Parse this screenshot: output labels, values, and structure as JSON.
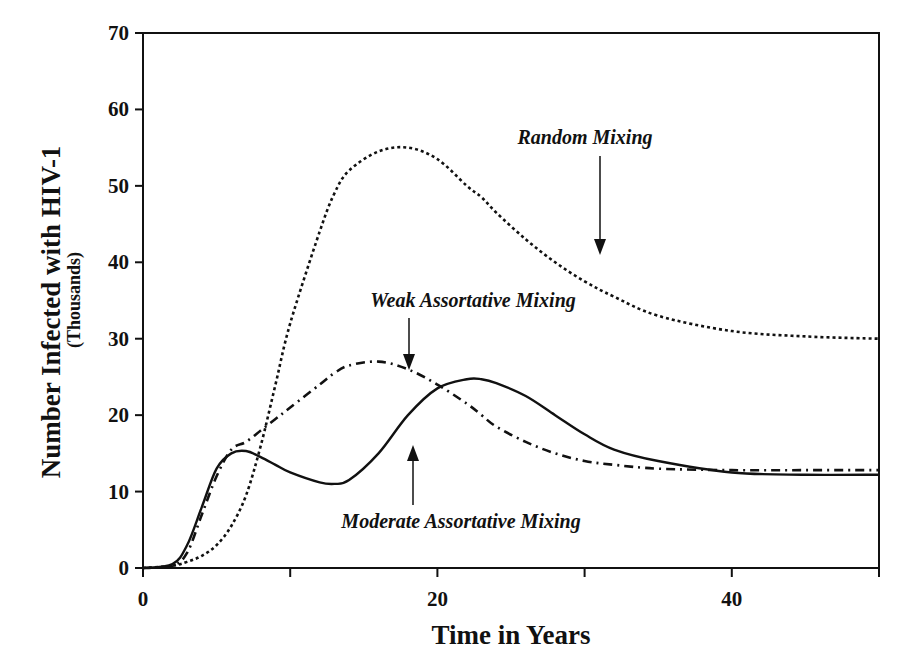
{
  "chart_data": {
    "type": "line",
    "title": "",
    "xlabel": "Time in Years",
    "ylabel": "Number Infected with HIV-1",
    "ylabel_sub": "(Thousands)",
    "xlim": [
      0,
      50
    ],
    "ylim": [
      0,
      70
    ],
    "x_ticks": [
      0,
      10,
      20,
      30,
      40,
      50
    ],
    "x_tick_labels": [
      "0",
      "20",
      "40"
    ],
    "y_ticks": [
      0,
      10,
      20,
      30,
      40,
      50,
      60,
      70
    ],
    "y_tick_labels": [
      "0",
      "10",
      "20",
      "30",
      "40",
      "50",
      "60",
      "70"
    ],
    "grid": false,
    "legend": "none (inline annotations with arrows)",
    "x": [
      0,
      2,
      3,
      4,
      5,
      6,
      7,
      8,
      9,
      10,
      12,
      13,
      14,
      16,
      18,
      20,
      22,
      23,
      24,
      26,
      28,
      30,
      32,
      35,
      40,
      45,
      50
    ],
    "series": [
      {
        "name": "Random Mixing",
        "style": "dotted",
        "values": [
          0,
          0.3,
          0.8,
          1.6,
          3.0,
          5.5,
          9.5,
          16,
          24,
          32,
          44,
          49,
          52,
          54.5,
          55,
          53.5,
          50,
          48.5,
          46.5,
          43,
          40,
          37.5,
          35.5,
          33,
          31,
          30.3,
          30
        ]
      },
      {
        "name": "Weak Assortative Mixing",
        "style": "dash-dot",
        "values": [
          0,
          0.3,
          2,
          7,
          12,
          15.5,
          16.5,
          18,
          19.5,
          21,
          24,
          25.5,
          26.5,
          27,
          26,
          24,
          21.5,
          20,
          18.5,
          16.5,
          15,
          14,
          13.5,
          13,
          12.8,
          12.8,
          12.8
        ]
      },
      {
        "name": "Moderate Assortative Mixing",
        "style": "solid",
        "values": [
          0,
          0.5,
          3,
          8,
          13,
          15,
          15.3,
          14.5,
          13.5,
          12.5,
          11.2,
          11,
          11.5,
          15,
          20,
          23.5,
          24.7,
          24.7,
          24.2,
          22.5,
          20,
          17.5,
          15.5,
          14,
          12.5,
          12.2,
          12.2
        ]
      }
    ],
    "annotations": [
      {
        "text": "Random Mixing",
        "arrow": "down",
        "points_to": {
          "x": 31,
          "y": 38
        }
      },
      {
        "text": "Weak Assortative Mixing",
        "arrow": "down",
        "points_to": {
          "x": 18,
          "y": 26
        }
      },
      {
        "text": "Moderate Assortative Mixing",
        "arrow": "up",
        "points_to": {
          "x": 18,
          "y": 18
        }
      }
    ]
  }
}
